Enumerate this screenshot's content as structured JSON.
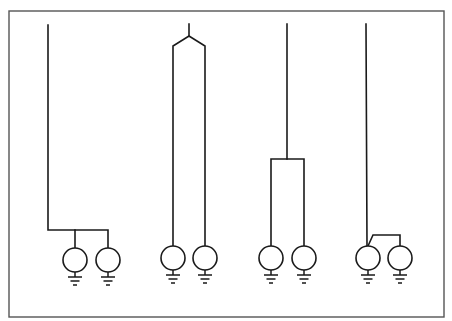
{
  "diagram": {
    "title": "",
    "colors": {
      "line": "#1a1a1a",
      "frame": "#555555",
      "background": "#ffffff"
    },
    "frame": {
      "x": 9,
      "y": 11,
      "width": 435,
      "height": 306
    },
    "symbol": {
      "type": "grounded-circle-source",
      "radius": 12
    },
    "groups": [
      {
        "id": "group-1",
        "arrangement": "single line, horizontal bus at bottom feeding two sources",
        "sources": [
          {
            "cx": 75,
            "cy": 260
          },
          {
            "cx": 108,
            "cy": 260
          }
        ]
      },
      {
        "id": "group-2",
        "arrangement": "single line splitting at top (V fork) into two long parallel leads",
        "sources": [
          {
            "cx": 173,
            "cy": 258
          },
          {
            "cx": 205,
            "cy": 258
          }
        ]
      },
      {
        "id": "group-3",
        "arrangement": "single line splitting at mid-height into two parallel leads",
        "sources": [
          {
            "cx": 271,
            "cy": 258
          },
          {
            "cx": 304,
            "cy": 258
          }
        ]
      },
      {
        "id": "group-4",
        "arrangement": "single line to first source, with short jumper bracket to second source",
        "sources": [
          {
            "cx": 368,
            "cy": 258
          },
          {
            "cx": 400,
            "cy": 258
          }
        ]
      }
    ]
  }
}
